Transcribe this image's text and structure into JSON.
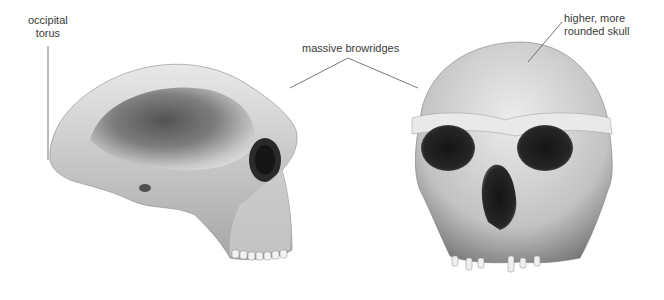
{
  "figure": {
    "type": "anatomical-comparison",
    "background_color": "#ffffff",
    "skull_colors": {
      "light": "#e4e4e4",
      "mid": "#a8a8a8",
      "dark": "#2a2a2a"
    }
  },
  "labels": {
    "occipital_torus": {
      "line1": "occipital",
      "line2": "torus"
    },
    "browridges": {
      "text": "massive browridges"
    },
    "rounded_skull": {
      "line1": "higher, more",
      "line2": "rounded skull"
    }
  },
  "views": [
    {
      "name": "lateral-view"
    },
    {
      "name": "frontal-view"
    }
  ]
}
